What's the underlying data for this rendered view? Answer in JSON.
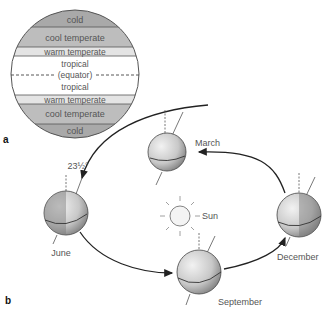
{
  "panel_a": {
    "label": "a",
    "bands": [
      {
        "name": "cold",
        "label": "cold",
        "y": 10,
        "h": 17,
        "color": "#a9a9a9"
      },
      {
        "name": "cool-temperate",
        "label": "cool temperate",
        "y": 27,
        "h": 20,
        "color": "#bdbdbd"
      },
      {
        "name": "warm-temperate",
        "label": "warm temperate",
        "y": 47,
        "h": 9,
        "color": "#e4e4e4"
      },
      {
        "name": "tropical-north",
        "label": "tropical",
        "y": 56,
        "h": 19,
        "color": "#ffffff"
      },
      {
        "name": "tropical-south",
        "label": "tropical",
        "y": 75,
        "h": 20,
        "color": "#ffffff"
      },
      {
        "name": "warm-temperate-south",
        "label": "warm temperate",
        "y": 95,
        "h": 9,
        "color": "#e4e4e4"
      },
      {
        "name": "cool-temperate-south",
        "label": "cool temperate",
        "y": 104,
        "h": 20,
        "color": "#bdbdbd"
      },
      {
        "name": "cold-south",
        "label": "cold",
        "y": 124,
        "h": 14,
        "color": "#a9a9a9"
      }
    ],
    "equator_label": "(equator)"
  },
  "panel_b": {
    "label": "b",
    "tilt_label": "23½°",
    "sun_label": "Sun",
    "months": {
      "march": "March",
      "june": "June",
      "september": "September",
      "december": "December"
    }
  }
}
